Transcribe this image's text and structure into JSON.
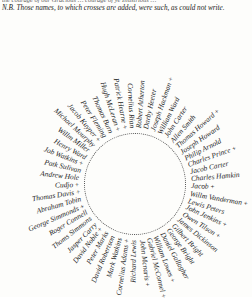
{
  "document": {
    "header_top": "the courage of our Gracious … courage of ye Illustrious …",
    "header_note": "N.B. Those names, to which crosses are added, were such, as could not write.",
    "cross_mark": "+",
    "names": [
      {
        "text": "Cornelius Rian",
        "cross": false
      },
      {
        "text": "Patrick Hearne",
        "cross": true
      },
      {
        "text": "Hugh McLeran",
        "cross": true
      },
      {
        "text": "Thomas Burn",
        "cross": false
      },
      {
        "text": "Peter Fleming",
        "cross": false
      },
      {
        "text": "Jacob Kuyper",
        "cross": true
      },
      {
        "text": "Michael Mourphy",
        "cross": false
      },
      {
        "text": "Willm Miller",
        "cross": false
      },
      {
        "text": "Henry Ward",
        "cross": false
      },
      {
        "text": "Job Watkins",
        "cross": true
      },
      {
        "text": "Patk Sulivan",
        "cross": false
      },
      {
        "text": "Andrew Hole",
        "cross": false
      },
      {
        "text": "Cudjo",
        "cross": true
      },
      {
        "text": "Thomas Davis",
        "cross": true
      },
      {
        "text": "Abraham Tobin",
        "cross": false
      },
      {
        "text": "George Simmonds",
        "cross": true
      },
      {
        "text": "Roger Connell",
        "cross": false
      },
      {
        "text": "Thoms Simmons",
        "cross": false
      },
      {
        "text": "Jasper Carry",
        "cross": false
      },
      {
        "text": "David Noble",
        "cross": true
      },
      {
        "text": "Peter Marks",
        "cross": false
      },
      {
        "text": "David Robertson",
        "cross": false
      },
      {
        "text": "Mark Watkins",
        "cross": false
      },
      {
        "text": "Cornelius Adams",
        "cross": true
      },
      {
        "text": "Richard Lewis",
        "cross": false
      },
      {
        "text": "John Mcnaris",
        "cross": true
      },
      {
        "text": "Gabriel McConnel",
        "cross": true
      },
      {
        "text": "William Lowes",
        "cross": true
      },
      {
        "text": "Daniel Gallagher",
        "cross": false
      },
      {
        "text": "George Bright",
        "cross": false
      },
      {
        "text": "Gilbert Bright",
        "cross": false
      },
      {
        "text": "James Dickinson",
        "cross": false
      },
      {
        "text": "Owen Tilson",
        "cross": true
      },
      {
        "text": "John Jenkins",
        "cross": true
      },
      {
        "text": "Lewis Peters",
        "cross": false
      },
      {
        "text": "Willm Vanderman",
        "cross": true
      },
      {
        "text": "Jacob",
        "cross": true
      },
      {
        "text": "Charles Hamkin",
        "cross": false
      },
      {
        "text": "Jacob Carter",
        "cross": false
      },
      {
        "text": "Charles Prince",
        "cross": true
      },
      {
        "text": "Philip Arnold",
        "cross": false
      },
      {
        "text": "Joseph Howard",
        "cross": false
      },
      {
        "text": "Thomas Howard",
        "cross": true
      },
      {
        "text": "Allen Smith",
        "cross": false
      },
      {
        "text": "John Carter",
        "cross": false
      },
      {
        "text": "William Ward",
        "cross": false
      },
      {
        "text": "Joseph Hackman",
        "cross": true
      },
      {
        "text": "Darby Heeter",
        "cross": false
      },
      {
        "text": "Robert Atherton",
        "cross": false
      }
    ]
  }
}
